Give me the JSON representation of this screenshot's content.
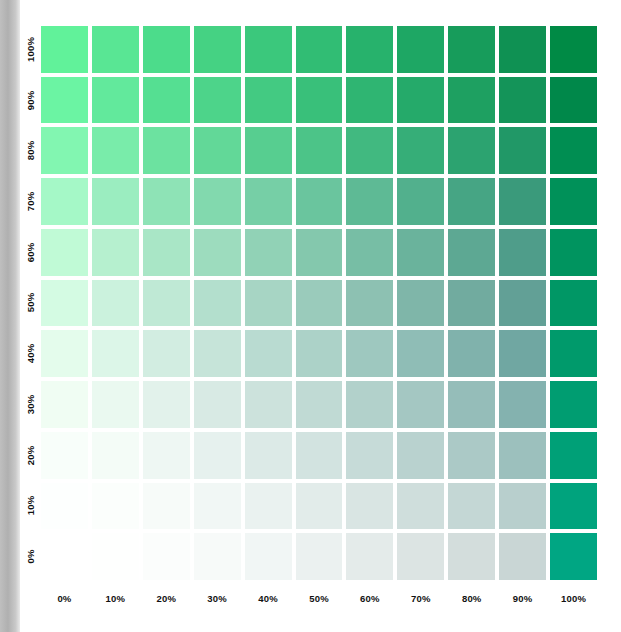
{
  "sidebar": {
    "chapter_label": "CHAPTER 4",
    "color": "#b8b8b8"
  },
  "chart_data": {
    "type": "heatmap",
    "title": "",
    "xlabel": "",
    "ylabel": "",
    "grid": false,
    "legend": "none",
    "x_tick_labels": [
      "0%",
      "10%",
      "20%",
      "30%",
      "40%",
      "50%",
      "60%",
      "70%",
      "80%",
      "90%",
      "100%"
    ],
    "y_tick_labels": [
      "100%",
      "90%",
      "80%",
      "70%",
      "60%",
      "50%",
      "40%",
      "30%",
      "20%",
      "10%",
      "0%"
    ],
    "x": [
      0,
      10,
      20,
      30,
      40,
      50,
      60,
      70,
      80,
      90,
      100
    ],
    "y": [
      100,
      90,
      80,
      70,
      60,
      50,
      40,
      30,
      20,
      10,
      0
    ],
    "xlim": [
      0,
      100
    ],
    "ylim": [
      0,
      100
    ],
    "columns": 11,
    "rows": 11,
    "cell_gap_px": 4,
    "colors": [
      [
        "#61f29a",
        "#59e694",
        "#4cdc8b",
        "#45d283",
        "#3bc87c",
        "#31bd74",
        "#27b26c",
        "#1ea764",
        "#179c5b",
        "#0f9153",
        "#008a45"
      ],
      [
        "#6bf4a3",
        "#62e99c",
        "#55df92",
        "#4dd48a",
        "#43ca82",
        "#39c07a",
        "#2fb572",
        "#25aa6a",
        "#1ea061",
        "#149459",
        "#00884a"
      ],
      [
        "#82f6b1",
        "#79ecaa",
        "#6ce2a0",
        "#62d898",
        "#57ce90",
        "#4cc488",
        "#41b980",
        "#36ae78",
        "#2ca370",
        "#219867",
        "#008e52"
      ],
      [
        "#a5f8c7",
        "#9bedc0",
        "#8ee3b6",
        "#82d9ae",
        "#76cfa6",
        "#6ac59e",
        "#5eba95",
        "#52b08d",
        "#46a584",
        "#3a9a7b",
        "#009159"
      ],
      [
        "#c0fad6",
        "#b6f0cf",
        "#a9e6c6",
        "#9ddcbe",
        "#91d2b6",
        "#84c8ad",
        "#77bea5",
        "#6ab39c",
        "#5da893",
        "#4f9d8a",
        "#00945f"
      ],
      [
        "#d4fbe3",
        "#cbf2dd",
        "#bfe9d5",
        "#b3dfcd",
        "#a7d5c4",
        "#9acbbb",
        "#8dc1b2",
        "#7fb6a9",
        "#71ab9f",
        "#62a096",
        "#009765"
      ],
      [
        "#e4fcec",
        "#dcf6e8",
        "#d2ede1",
        "#c6e4d9",
        "#b9dbd1",
        "#acd2c8",
        "#9ec8bf",
        "#8fbdb6",
        "#80b2ac",
        "#70a7a2",
        "#009a6b"
      ],
      [
        "#f0fdf3",
        "#eaf9f0",
        "#e2f2eb",
        "#d8eae4",
        "#cce2dc",
        "#c0dad4",
        "#b2d1cb",
        "#a4c7c2",
        "#95bdb9",
        "#84b2af",
        "#009d71"
      ],
      [
        "#f8fefa",
        "#f4fcf7",
        "#eef7f3",
        "#e6f1ee",
        "#dceae7",
        "#d2e3e0",
        "#c6dbd8",
        "#b9d2cf",
        "#abc9c6",
        "#9cc0bd",
        "#00a077"
      ],
      [
        "#fdfffe",
        "#fbfefc",
        "#f7fbf9",
        "#f1f7f5",
        "#eaf2f0",
        "#e2ecea",
        "#d9e5e3",
        "#cfdedc",
        "#c4d7d5",
        "#b8cfcd",
        "#00a37d"
      ],
      [
        "#ffffff",
        "#fefffe",
        "#fbfdfc",
        "#f7faf9",
        "#f1f6f5",
        "#ebf1f0",
        "#e4ebea",
        "#dce4e3",
        "#d3dddc",
        "#c9d6d5",
        "#00a683"
      ]
    ],
    "colors_note": "11 rows top(100%)->bottom(0%), 11 columns left(0%)->right(100%)"
  }
}
